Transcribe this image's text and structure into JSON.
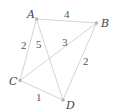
{
  "diagram": {
    "type": "weighted-graph",
    "nodes": [
      {
        "id": "A",
        "label": "A",
        "x": 36.5,
        "y": 19,
        "label_x": 27,
        "label_y": 18
      },
      {
        "id": "B",
        "label": "B",
        "x": 96.5,
        "y": 23,
        "label_x": 101,
        "label_y": 27
      },
      {
        "id": "C",
        "label": "C",
        "x": 20,
        "y": 80.5,
        "label_x": 9,
        "label_y": 85
      },
      {
        "id": "D",
        "label": "D",
        "x": 63,
        "y": 100,
        "label_x": 66,
        "label_y": 109
      }
    ],
    "edges": [
      {
        "from": "A",
        "to": "B",
        "weight": "4",
        "label_x": 64,
        "label_y": 18
      },
      {
        "from": "A",
        "to": "C",
        "weight": "2",
        "label_x": 21,
        "label_y": 49
      },
      {
        "from": "A",
        "to": "D",
        "weight": "5",
        "label_x": 36,
        "label_y": 48
      },
      {
        "from": "B",
        "to": "C",
        "weight": "3",
        "label_x": 62,
        "label_y": 46
      },
      {
        "from": "B",
        "to": "D",
        "weight": "2",
        "label_x": 83,
        "label_y": 65
      },
      {
        "from": "C",
        "to": "D",
        "weight": "1",
        "label_x": 36,
        "label_y": 101
      }
    ]
  },
  "colors": {
    "edge": "#d4d4d4",
    "node": "#b8b8b8",
    "node_label": "#444444",
    "weight_label": "#555555"
  }
}
